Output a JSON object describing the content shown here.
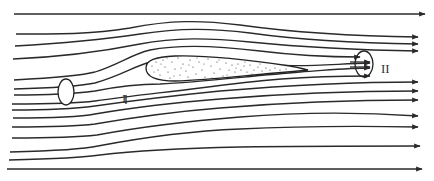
{
  "diagram": {
    "type": "streamline flow around an airfoil",
    "labels": {
      "section_1": "I",
      "section_2": "II"
    },
    "colors": {
      "stroke": "#2a2a2a",
      "background": "#ffffff",
      "stipple": "#333333"
    },
    "elements": [
      {
        "name": "streamlines",
        "count": 15
      },
      {
        "name": "airfoil",
        "fill": "stippled"
      },
      {
        "name": "control-ellipse-upstream"
      },
      {
        "name": "control-ellipse-downstream"
      }
    ]
  }
}
